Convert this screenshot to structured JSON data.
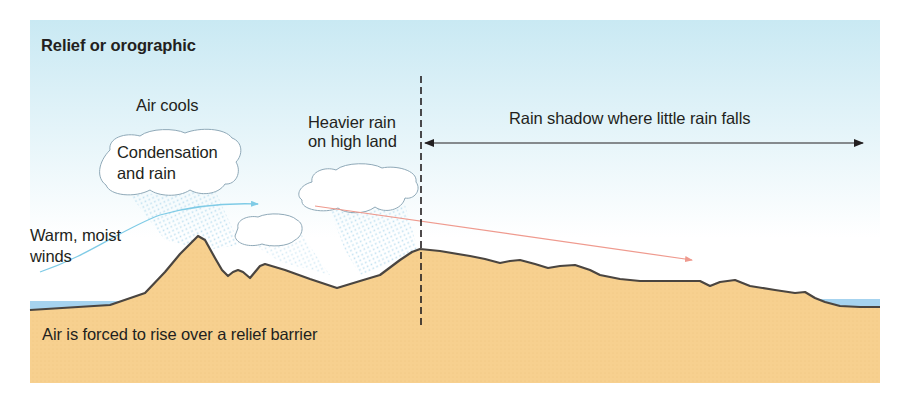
{
  "diagram": {
    "title": "Relief or orographic",
    "labels": {
      "air_cools": "Air cools",
      "condensation_line1": "Condensation",
      "condensation_line2": "and rain",
      "heavier_rain_line1": "Heavier rain",
      "heavier_rain_line2": "on high land",
      "rain_shadow": "Rain shadow where little rain falls",
      "warm_moist_line1": "Warm, moist",
      "warm_moist_line2": "winds",
      "forced_to_rise": "Air is forced to rise over a relief barrier"
    },
    "colors": {
      "sky_top": "#c9e9f3",
      "sky_bottom": "#ffffff",
      "ground": "#f7d08f",
      "ground_outline": "#4a4540",
      "water": "#a6d3ef",
      "wind_arrow": "#7fcbe6",
      "descending_air_arrow": "#ef9a8e",
      "cloud_outline": "#8fa9b8",
      "rain_stipple": "#b9dcee",
      "divider": "#231f20"
    },
    "elements": [
      "warm-moist-wind-arrow",
      "cloud-condensation",
      "cloud-small",
      "cloud-high-land",
      "rain-shadow-double-arrow",
      "dashed-divider-line",
      "descending-air-arrow",
      "relief-barrier-ground",
      "sea-left",
      "sea-right"
    ]
  }
}
